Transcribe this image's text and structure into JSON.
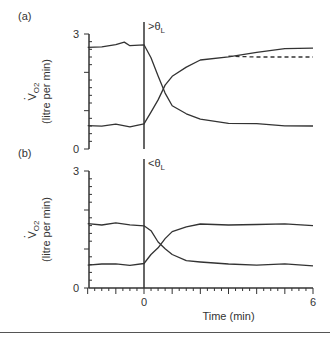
{
  "chart_data": [
    {
      "type": "line",
      "panel_label": "(a)",
      "annotation": ">θL",
      "annotation_main": ">θ",
      "annotation_sub": "L",
      "ylabel": "V̇O2 (litre per min)",
      "ylabel_main": "V",
      "ylabel_sub": "O2",
      "ylabel_units": "(litre per min)",
      "yticks": [
        "0",
        "3"
      ],
      "ylim": [
        0,
        3
      ],
      "xlim": [
        -2,
        6
      ],
      "series": [
        {
          "name": "upper (decreasing)",
          "x": [
            -2,
            -1.5,
            -1,
            -0.7,
            -0.5,
            0,
            0.25,
            0.5,
            0.75,
            1,
            1.5,
            2,
            3,
            4,
            5,
            6
          ],
          "values": [
            2.65,
            2.68,
            2.7,
            2.8,
            2.7,
            2.7,
            2.4,
            1.9,
            1.45,
            1.15,
            0.9,
            0.78,
            0.68,
            0.64,
            0.62,
            0.6
          ]
        },
        {
          "name": "lower (increasing)",
          "x": [
            -2,
            -1.5,
            -1,
            -0.5,
            0,
            0.25,
            0.5,
            0.75,
            1,
            1.5,
            2,
            3,
            4,
            5,
            6
          ],
          "values": [
            0.62,
            0.6,
            0.63,
            0.6,
            0.65,
            0.95,
            1.3,
            1.65,
            1.9,
            2.15,
            2.3,
            2.42,
            2.52,
            2.6,
            2.65
          ]
        },
        {
          "name": "model fit (dashed)",
          "x": [
            3,
            4,
            5,
            6
          ],
          "values": [
            2.42,
            2.4,
            2.4,
            2.4
          ],
          "style": "dashed"
        }
      ]
    },
    {
      "type": "line",
      "panel_label": "(b)",
      "annotation": "<θL",
      "annotation_main": "<θ",
      "annotation_sub": "L",
      "ylabel": "V̇O2 (litre per min)",
      "ylabel_main": "V",
      "ylabel_sub": "O2",
      "ylabel_units": "(litre per min)",
      "yticks": [
        "0",
        "3"
      ],
      "xticks": [
        "0",
        "6"
      ],
      "xlabel": "Time (min)",
      "ylim": [
        0,
        3
      ],
      "xlim": [
        -2,
        6
      ],
      "series": [
        {
          "name": "upper (decreasing)",
          "x": [
            -2,
            -1.5,
            -1,
            -0.5,
            0,
            0.25,
            0.5,
            0.75,
            1,
            1.5,
            2,
            3,
            4,
            5,
            6
          ],
          "values": [
            1.65,
            1.63,
            1.65,
            1.63,
            1.6,
            1.45,
            1.2,
            1.0,
            0.85,
            0.72,
            0.65,
            0.62,
            0.6,
            0.6,
            0.58
          ]
        },
        {
          "name": "lower (increasing)",
          "x": [
            -2,
            -1.5,
            -1,
            -0.5,
            0,
            0.25,
            0.5,
            0.75,
            1,
            1.5,
            2,
            3,
            4,
            5,
            6
          ],
          "values": [
            0.6,
            0.62,
            0.6,
            0.6,
            0.62,
            0.85,
            1.05,
            1.25,
            1.45,
            1.58,
            1.62,
            1.63,
            1.63,
            1.63,
            1.62
          ]
        }
      ]
    }
  ]
}
